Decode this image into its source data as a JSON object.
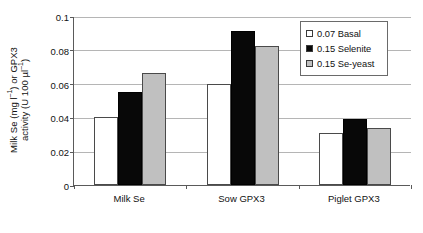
{
  "chart_data": {
    "type": "bar",
    "title": "",
    "xlabel": "",
    "ylabel_line1": "Milk Se (mg l⁻¹) or GPX3",
    "ylabel_line2": "activity (U 100 µl⁻¹)",
    "categories": [
      "Milk Se",
      "Sow GPX3",
      "Piglet GPX3"
    ],
    "series": [
      {
        "name": "0.07 Basal",
        "color": "#ffffff",
        "values": [
          0.04,
          0.06,
          0.031
        ]
      },
      {
        "name": "0.15 Selenite",
        "color": "#080808",
        "values": [
          0.055,
          0.091,
          0.039
        ]
      },
      {
        "name": "0.15 Se-yeast",
        "color": "#c0c0c0",
        "values": [
          0.066,
          0.082,
          0.034
        ]
      }
    ],
    "ylim": [
      0,
      0.1
    ],
    "yticks": [
      "0",
      "0.02",
      "0.04",
      "0.06",
      "0.08",
      "0.1"
    ],
    "ytick_values": [
      0,
      0.02,
      0.04,
      0.06,
      0.08,
      0.1
    ],
    "grid": true,
    "legend_position": "top-right"
  },
  "legend": {
    "items": [
      {
        "label": "0.07 Basal"
      },
      {
        "label": "0.15 Selenite"
      },
      {
        "label": "0.15 Se-yeast"
      }
    ]
  }
}
